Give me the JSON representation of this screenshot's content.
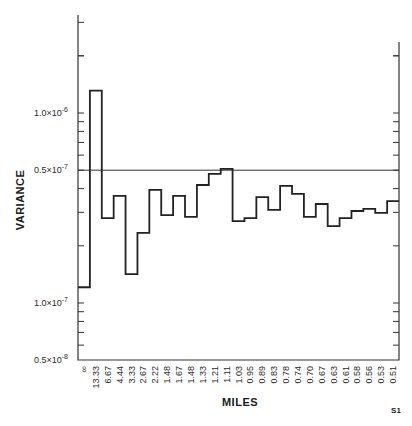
{
  "chart_data": {
    "type": "line",
    "subtype": "step",
    "title": "",
    "xlabel": "MILES",
    "ylabel": "VARIANCE",
    "figure_id": "S1",
    "yscale": "log",
    "ylim": [
      5e-09,
      2.6e-06
    ],
    "grid": false,
    "legend": null,
    "y_tick_labels": [
      {
        "label": "1.0×10⁻⁶",
        "base": "1.0×10",
        "exp": "-6",
        "value": 1e-06
      },
      {
        "label": "0.5×10⁻⁷",
        "base": "0.5×10",
        "exp": "-7",
        "value": 5e-07
      },
      {
        "label": "1.0×10⁻⁷",
        "base": "1.0×10",
        "exp": "-7",
        "value": 1e-07
      },
      {
        "label": "0.5×10⁻⁸",
        "base": "0.5×10",
        "exp": "-8",
        "value": 5e-08
      }
    ],
    "reference_line": {
      "value": 5e-07,
      "label": "0.5×10⁻⁷"
    },
    "categories": [
      "∞",
      "13.33",
      "6.67",
      "4.44",
      "3.33",
      "2.67",
      "2.22",
      "1.48",
      "1.67",
      "1.48",
      "1.33",
      "1.21",
      "1.11",
      "1.03",
      "0.95",
      "0.89",
      "0.83",
      "0.78",
      "0.74",
      "0.70",
      "0.67",
      "0.63",
      "0.61",
      "0.58",
      "0.56",
      "0.53",
      "0.51"
    ],
    "values": [
      1.21e-07,
      1.31e-06,
      2.8e-07,
      3.66e-07,
      1.42e-07,
      2.34e-07,
      3.94e-07,
      2.9e-07,
      3.66e-07,
      2.84e-07,
      4.18e-07,
      4.78e-07,
      5.08e-07,
      2.7e-07,
      2.8e-07,
      3.61e-07,
      3.09e-07,
      4.13e-07,
      3.75e-07,
      2.84e-07,
      3.32e-07,
      2.54e-07,
      2.8e-07,
      3.05e-07,
      3.13e-07,
      2.98e-07,
      3.44e-07
    ]
  },
  "layout": {
    "plot_left": 78,
    "plot_right": 399,
    "plot_bottom": 360,
    "left_axis_top": 15,
    "right_axis_top": 42,
    "step_start_x": 78,
    "step_width": 11.89,
    "decade_px": 190,
    "y_1e6_px": 113
  }
}
